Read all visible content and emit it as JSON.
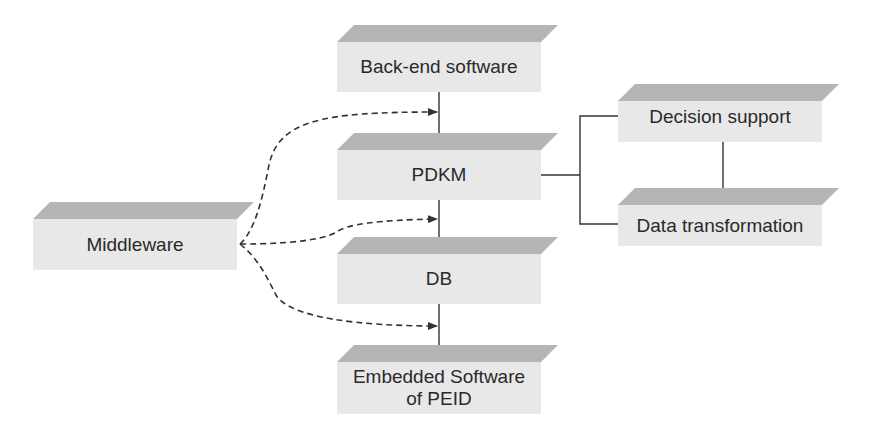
{
  "diagram": {
    "nodes": {
      "backend": {
        "label": "Back-end software"
      },
      "pdkm": {
        "label": "PDKM"
      },
      "db": {
        "label": "DB"
      },
      "embedded": {
        "label": "Embedded Software of PEID"
      },
      "middleware": {
        "label": "Middleware"
      },
      "decision": {
        "label": "Decision support"
      },
      "transform": {
        "label": "Data transformation"
      }
    },
    "edges": [
      {
        "from": "backend",
        "to": "pdkm",
        "style": "solid"
      },
      {
        "from": "pdkm",
        "to": "db",
        "style": "solid"
      },
      {
        "from": "db",
        "to": "embedded",
        "style": "solid"
      },
      {
        "from": "pdkm",
        "to": "decision",
        "style": "solid"
      },
      {
        "from": "pdkm",
        "to": "transform",
        "style": "solid"
      },
      {
        "from": "decision",
        "to": "transform",
        "style": "solid"
      },
      {
        "from": "middleware",
        "to": "backend-pdkm-link",
        "style": "dashed-arrow"
      },
      {
        "from": "middleware",
        "to": "pdkm-db-link",
        "style": "dashed-arrow"
      },
      {
        "from": "middleware",
        "to": "db-embedded-link",
        "style": "dashed-arrow"
      }
    ],
    "colors": {
      "top_face": "#b5b5b5",
      "front_face": "#e8e8e8",
      "text": "#2a2a2a",
      "line": "#333333"
    }
  }
}
